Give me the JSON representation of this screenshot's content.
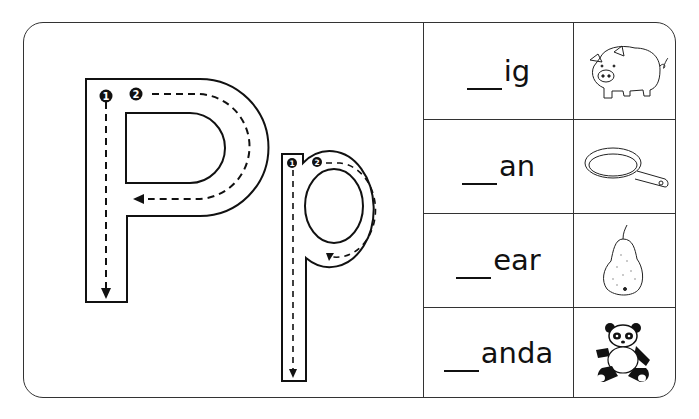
{
  "worksheet": {
    "letter_upper": "P",
    "letter_lower": "p",
    "stroke_numbers": [
      "1",
      "2"
    ],
    "rows": [
      {
        "blank": "___",
        "suffix": "ig",
        "picture": "pig"
      },
      {
        "blank": "___",
        "suffix": "an",
        "picture": "pan"
      },
      {
        "blank": "___",
        "suffix": "ear",
        "picture": "pear"
      },
      {
        "blank": "___",
        "suffix": "anda",
        "picture": "panda"
      }
    ]
  },
  "colors": {
    "ink": "#111111",
    "border": "#333333",
    "background": "#ffffff"
  }
}
